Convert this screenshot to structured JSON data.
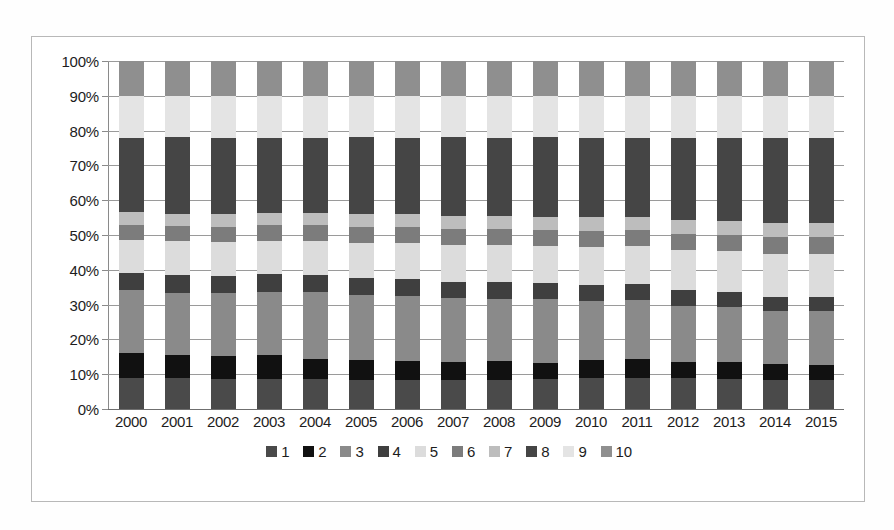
{
  "chart_data": {
    "type": "bar",
    "subtype": "stacked-100-percent",
    "title": "",
    "xlabel": "",
    "ylabel": "",
    "ylim": [
      0,
      100
    ],
    "y_tick_labels": [
      "0%",
      "10%",
      "20%",
      "30%",
      "40%",
      "50%",
      "60%",
      "70%",
      "80%",
      "90%",
      "100%"
    ],
    "y_ticks": [
      0,
      10,
      20,
      30,
      40,
      50,
      60,
      70,
      80,
      90,
      100
    ],
    "grid": true,
    "legend_position": "bottom",
    "categories": [
      "2000",
      "2001",
      "2002",
      "2003",
      "2004",
      "2005",
      "2006",
      "2007",
      "2008",
      "2009",
      "2010",
      "2011",
      "2012",
      "2013",
      "2014",
      "2015"
    ],
    "series": [
      {
        "name": "1",
        "color": "#4a4a4a",
        "values": [
          9.0,
          8.8,
          8.7,
          8.6,
          8.5,
          8.4,
          8.3,
          8.2,
          8.4,
          8.6,
          8.8,
          9.0,
          8.8,
          8.6,
          8.4,
          8.2
        ]
      },
      {
        "name": "2",
        "color": "#111111",
        "values": [
          7.0,
          6.8,
          6.6,
          6.8,
          6.0,
          5.8,
          5.5,
          5.2,
          5.4,
          4.6,
          5.4,
          5.4,
          4.8,
          4.8,
          4.6,
          4.4
        ]
      },
      {
        "name": "3",
        "color": "#8a8a8a",
        "values": [
          18.2,
          17.8,
          18.0,
          18.3,
          19.2,
          18.6,
          18.8,
          18.4,
          17.9,
          18.5,
          16.8,
          16.8,
          16.1,
          15.8,
          15.1,
          15.6
        ]
      },
      {
        "name": "4",
        "color": "#3f3f3f",
        "values": [
          5.0,
          5.2,
          5.0,
          5.0,
          4.8,
          4.8,
          4.8,
          4.6,
          4.8,
          4.6,
          4.6,
          4.6,
          4.4,
          4.4,
          4.2,
          4.0
        ]
      },
      {
        "name": "5",
        "color": "#dcdcdc",
        "values": [
          9.5,
          9.6,
          9.6,
          9.6,
          9.8,
          10.2,
          10.3,
          10.8,
          10.7,
          10.5,
          11.0,
          11.0,
          11.5,
          11.8,
          12.2,
          12.4
        ]
      },
      {
        "name": "6",
        "color": "#7c7c7c",
        "values": [
          4.3,
          4.4,
          4.5,
          4.5,
          4.5,
          4.6,
          4.6,
          4.6,
          4.6,
          4.6,
          4.6,
          4.6,
          4.7,
          4.7,
          4.8,
          4.8
        ]
      },
      {
        "name": "7",
        "color": "#bdbdbd",
        "values": [
          3.5,
          3.5,
          3.6,
          3.6,
          3.6,
          3.7,
          3.7,
          3.8,
          3.8,
          3.8,
          3.9,
          3.9,
          4.0,
          4.0,
          4.1,
          4.1
        ]
      },
      {
        "name": "8",
        "color": "#454545",
        "values": [
          21.5,
          22.0,
          22.0,
          21.6,
          21.6,
          22.0,
          21.8,
          22.5,
          22.3,
          22.9,
          22.9,
          22.7,
          23.7,
          23.9,
          24.6,
          24.5
        ]
      },
      {
        "name": "9",
        "color": "#e4e4e4",
        "values": [
          12.0,
          12.0,
          12.0,
          12.0,
          12.0,
          11.9,
          12.2,
          11.9,
          12.1,
          11.9,
          12.0,
          12.0,
          12.0,
          12.0,
          12.0,
          12.0
        ]
      },
      {
        "name": "10",
        "color": "#8f8f8f",
        "values": [
          10.0,
          9.9,
          10.0,
          10.0,
          10.0,
          10.0,
          10.0,
          10.0,
          10.0,
          10.0,
          10.0,
          10.0,
          10.0,
          10.0,
          10.0,
          10.0
        ]
      }
    ]
  },
  "chart": {
    "axis_color": "#8a8a8a",
    "grid_color": "#9a9a9a",
    "border_color": "#b8b8b8",
    "background": "#ffffff",
    "text_color": "#1d1d1d"
  }
}
